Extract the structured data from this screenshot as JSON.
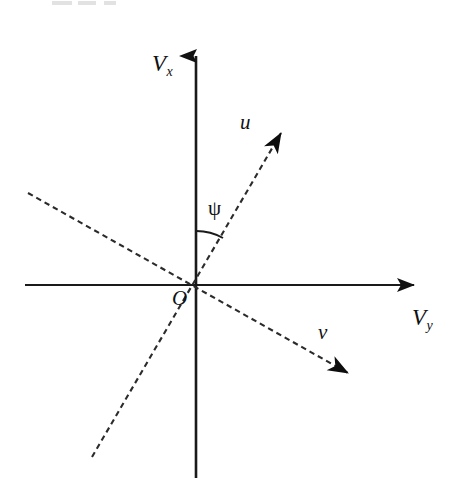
{
  "figure": {
    "background_color": "#ffffff",
    "stroke_color": "#1a1a1a",
    "dash_color": "#2b2b2b",
    "width": 457,
    "height": 497
  },
  "axes": {
    "vertical": {
      "name": "V_x",
      "label_main": "V",
      "label_sub": "x",
      "label_x": 152,
      "label_y": 52,
      "x": 196,
      "y_top": 42,
      "y_bottom": 478,
      "arrow": "up"
    },
    "horizontal": {
      "name": "V_y",
      "label_main": "V",
      "label_sub": "y",
      "label_x": 412,
      "label_y": 306,
      "y": 285,
      "x_left": 25,
      "x_right": 430,
      "arrow": "right"
    }
  },
  "origin": {
    "label": "O",
    "x": 196,
    "y": 285,
    "label_x": 172,
    "label_y": 288
  },
  "vectors": [
    {
      "name": "u",
      "label": "u",
      "label_x": 240,
      "label_y": 112,
      "style": "dashed",
      "from_x": 92,
      "from_y": 457,
      "to_x": 297,
      "to_y": 110,
      "arrow_at": "head",
      "angle_from_vertical_deg": 30
    },
    {
      "name": "v",
      "label": "v",
      "label_x": 318,
      "label_y": 322,
      "style": "dashed",
      "from_x": 28,
      "from_y": 193,
      "to_x": 365,
      "to_y": 382,
      "arrow_at": "head",
      "angle_from_horizontal_deg": 30
    }
  ],
  "angle_arc": {
    "symbol": "ψ",
    "name": "psi",
    "label_x": 208,
    "label_y": 198,
    "vertex_x": 196,
    "vertex_y": 285,
    "radius": 54,
    "start_deg": 90,
    "end_deg": 60,
    "between": [
      "V_x axis",
      "u vector"
    ]
  },
  "artifacts": {
    "top_smudges": [
      {
        "left": 52,
        "width": 20
      },
      {
        "left": 78,
        "width": 18
      },
      {
        "left": 104,
        "width": 12
      }
    ]
  }
}
